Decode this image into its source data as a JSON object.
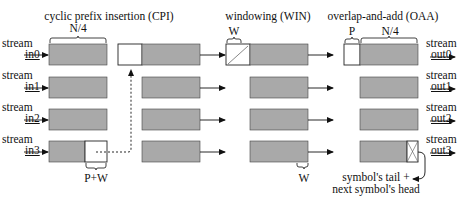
{
  "sections": {
    "cpi": "cyclic prefix insertion (CPI)",
    "win": "windowing (WIN)",
    "oaa": "overlap-and-add (OAA)"
  },
  "inputs": [
    {
      "line1": "stream",
      "line2": "in0"
    },
    {
      "line1": "stream",
      "line2": "in1"
    },
    {
      "line1": "stream",
      "line2": "in2"
    },
    {
      "line1": "stream",
      "line2": "in3"
    }
  ],
  "outputs": [
    {
      "line1": "stream",
      "line2": "out0"
    },
    {
      "line1": "stream",
      "line2": "out1"
    },
    {
      "line1": "stream",
      "line2": "out2"
    },
    {
      "line1": "stream",
      "line2": "out3"
    }
  ],
  "labels": {
    "n4_in": "N/4",
    "pw": "P+W",
    "w_top": "W",
    "w_bottom": "W",
    "p_top": "P",
    "n4_out": "N/4",
    "tail_line1": "symbol's tail +",
    "tail_line2": "next symbol's head"
  },
  "colors": {
    "block_fill": "#a9a9a9",
    "block_stroke": "#333333",
    "white_box": "#ffffff"
  }
}
